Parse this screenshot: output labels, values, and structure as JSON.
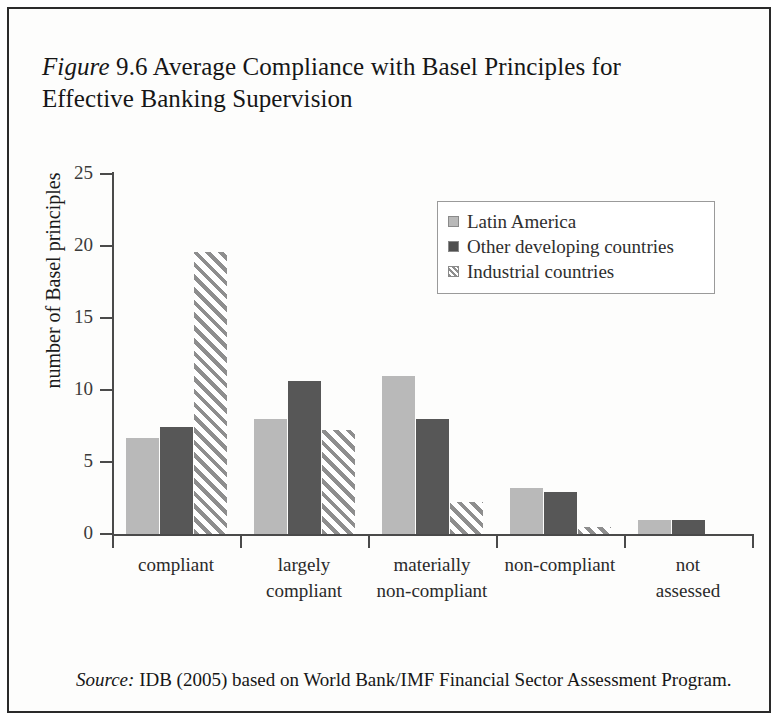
{
  "figure": {
    "label_italic": "Figure",
    "number": "9.6",
    "title": "Average Compliance with Basel Principles for Effective Banking Supervision",
    "source_label": "Source:",
    "source_text": "IDB (2005) based on World Bank/IMF Financial Sector Assessment Program."
  },
  "chart_data": {
    "type": "bar",
    "title": "Figure 9.6 Average Compliance with Basel Principles for Effective Banking Supervision",
    "xlabel": "",
    "ylabel": "number of Basel principles",
    "ylim": [
      0,
      25
    ],
    "yticks": [
      0,
      5,
      10,
      15,
      20,
      25
    ],
    "ytick_labels": [
      "0",
      "5",
      "10",
      "15",
      "20",
      "25"
    ],
    "grid": false,
    "legend_position": "upper-right-inside",
    "categories": [
      "compliant",
      "largely compliant",
      "materially non-compliant",
      "non-compliant",
      "not assessed"
    ],
    "category_lines": [
      [
        "compliant"
      ],
      [
        "largely",
        "compliant"
      ],
      [
        "materially",
        "non-compliant"
      ],
      [
        "non-compliant"
      ],
      [
        "not",
        "assessed"
      ]
    ],
    "series": [
      {
        "name": "Latin America",
        "color": "#b9b9b9",
        "pattern": "solid",
        "values": [
          6.7,
          8.0,
          11.0,
          3.2,
          1.0
        ]
      },
      {
        "name": "Other developing countries",
        "color": "#575757",
        "pattern": "solid",
        "values": [
          7.4,
          10.6,
          8.0,
          2.9,
          1.0
        ]
      },
      {
        "name": "Industrial countries",
        "color": "#8e8e8e",
        "pattern": "diagonal-hatch",
        "values": [
          19.6,
          7.2,
          2.2,
          0.5,
          0.0
        ]
      }
    ]
  }
}
